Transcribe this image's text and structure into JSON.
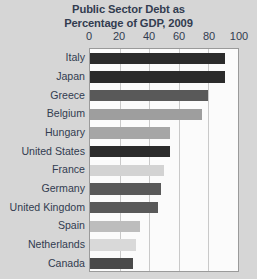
{
  "chart_data": {
    "type": "bar",
    "orientation": "horizontal",
    "title": "Public Sector Debt as Percentage of GDP, 2009",
    "title_lines": [
      "Public Sector Debt as",
      "Percentage of GDP, 2009"
    ],
    "xlabel": "",
    "ylabel": "",
    "xlim": [
      0,
      100
    ],
    "xticks": [
      0,
      20,
      40,
      60,
      80,
      100
    ],
    "xtick_labels": [
      "0",
      "20",
      "40",
      "60",
      "80",
      "100"
    ],
    "grid": "vertical",
    "legend": "none",
    "categories": [
      "Italy",
      "Japan",
      "Greece",
      "Belgium",
      "Hungary",
      "United States",
      "France",
      "Germany",
      "United Kingdom",
      "Spain",
      "Netherlands",
      "Canada"
    ],
    "values": [
      91,
      91,
      80,
      76,
      54,
      54,
      50,
      48,
      46,
      34,
      31,
      29
    ],
    "bar_colors": [
      "#2b2b2b",
      "#2b2b2b",
      "#595959",
      "#9e9e9e",
      "#a6a6a6",
      "#2b2b2b",
      "#d3d3d3",
      "#595959",
      "#595959",
      "#bdbdbd",
      "#d9d9d9",
      "#4a4a4a"
    ]
  },
  "style": {
    "background": "#d6d6d6",
    "plot_background": "#fbfbfb",
    "text_color": "#323c50",
    "gridline_color": "#c9c9c9",
    "border_color": "#9a9a9a"
  }
}
